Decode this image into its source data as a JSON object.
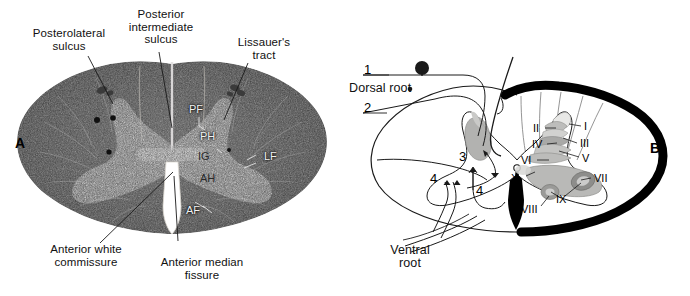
{
  "figure": {
    "panels": [
      {
        "id": "A",
        "kind": "histological-cross-section",
        "panel_label": "A",
        "callouts": [
          {
            "name": "posterolateral-sulcus",
            "text": "Posterolateral\nsulcus"
          },
          {
            "name": "posterior-intermediate-sulcus",
            "text": "Posterior\nintermediate\nsulcus"
          },
          {
            "name": "lissauers-tract",
            "text": "Lissauer's\ntract"
          },
          {
            "name": "anterior-white-commissure",
            "text": "Anterior white\ncommissure"
          },
          {
            "name": "anterior-median-fissure",
            "text": "Anterior median\nfissure"
          }
        ],
        "inline_labels": [
          {
            "name": "posterior-funiculus",
            "text": "PF"
          },
          {
            "name": "posterior-horn",
            "text": "PH"
          },
          {
            "name": "intermediate-gray",
            "text": "IG"
          },
          {
            "name": "anterior-horn",
            "text": "AH"
          },
          {
            "name": "lateral-funiculus",
            "text": "LF"
          },
          {
            "name": "anterior-funiculus",
            "text": "AF"
          }
        ]
      },
      {
        "id": "B",
        "kind": "schematic-diagram",
        "panel_label": "B",
        "callouts": [
          {
            "name": "dorsal-root",
            "text": "Dorsal root"
          },
          {
            "name": "ventral-root",
            "text": "Ventral\nroot"
          }
        ],
        "neuron_numbers": [
          {
            "name": "neuron-1",
            "text": "1"
          },
          {
            "name": "neuron-2",
            "text": "2"
          },
          {
            "name": "neuron-3",
            "text": "3"
          },
          {
            "name": "neuron-4a",
            "text": "4"
          },
          {
            "name": "neuron-4b",
            "text": "4"
          }
        ],
        "rexed_laminae": [
          {
            "name": "lamina-I",
            "text": "I"
          },
          {
            "name": "lamina-II",
            "text": "II"
          },
          {
            "name": "lamina-III",
            "text": "III"
          },
          {
            "name": "lamina-IV",
            "text": "IV"
          },
          {
            "name": "lamina-V",
            "text": "V"
          },
          {
            "name": "lamina-VI",
            "text": "VI"
          },
          {
            "name": "lamina-VII",
            "text": "VII"
          },
          {
            "name": "lamina-VIII",
            "text": "VIII"
          },
          {
            "name": "lamina-IX",
            "text": "IX"
          },
          {
            "name": "lamina-X",
            "text": "X"
          }
        ]
      }
    ],
    "colors": {
      "background": "#ffffff",
      "ink": "#000000",
      "white_matter_dark": "#3a3a3a",
      "gray_matter_light": "#c9c6bd",
      "lamina_shade_light": "#d6d6d4",
      "lamina_shade_mid": "#b4b4b2",
      "lamina_shade_dark": "#8f8f8d",
      "leader_line": "#1a1a1a"
    }
  }
}
